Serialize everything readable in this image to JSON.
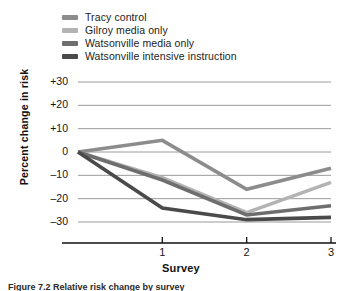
{
  "chart_data": {
    "type": "line",
    "title": "",
    "xlabel": "Survey",
    "ylabel": "Percent change in risk",
    "x": [
      0,
      1,
      2,
      3
    ],
    "x_tick_labels": [
      "1",
      "2",
      "3"
    ],
    "x_tick_values": [
      1,
      2,
      3
    ],
    "y_tick_labels": [
      "+30",
      "+20",
      "+10",
      "0",
      "–10",
      "–20",
      "–30"
    ],
    "y_tick_values": [
      30,
      20,
      10,
      0,
      -10,
      -20,
      -30
    ],
    "ylim": [
      -35,
      32
    ],
    "xlim": [
      -0.15,
      3.35
    ],
    "grid": "horizontal",
    "legend_position": "above-plot",
    "series": [
      {
        "name": "Tracy control",
        "color": "#8c8c8c",
        "values": [
          0,
          5,
          -16,
          -7
        ]
      },
      {
        "name": "Gilroy media only",
        "color": "#b3b3b3",
        "values": [
          0,
          -11,
          -26,
          -13
        ]
      },
      {
        "name": "Watsonville media only",
        "color": "#6e6e6e",
        "values": [
          0,
          -12,
          -27,
          -23
        ]
      },
      {
        "name": "Watsonville intensive instruction",
        "color": "#4a4a4a",
        "values": [
          0,
          -24,
          -29,
          -28
        ]
      }
    ]
  },
  "legend": {
    "items": [
      {
        "label": "Tracy control",
        "color": "#8c8c8c"
      },
      {
        "label": "Gilroy media only",
        "color": "#b3b3b3"
      },
      {
        "label": "Watsonville media only",
        "color": "#6e6e6e"
      },
      {
        "label": "Watsonville intensive instruction",
        "color": "#4a4a4a"
      }
    ]
  },
  "axes": {
    "y_title": "Percent change in risk",
    "x_title": "Survey"
  },
  "caption": {
    "text": "Figure 7.2  Relative risk change by survey"
  },
  "colors": {
    "axis": "#111111",
    "grid": "#8f8f8f",
    "text": "#141414"
  }
}
